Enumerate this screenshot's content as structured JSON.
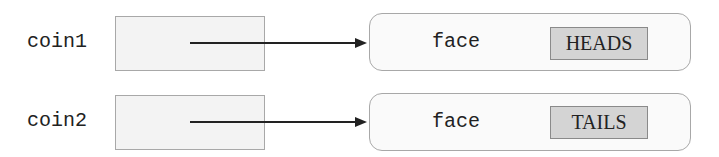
{
  "diagram": {
    "variables": [
      {
        "name": "coin1",
        "object": {
          "field": "face",
          "value": "HEADS"
        }
      },
      {
        "name": "coin2",
        "object": {
          "field": "face",
          "value": "TAILS"
        }
      }
    ],
    "colors": {
      "var_box_fill": "#f3f3f3",
      "value_box_fill": "#d4d4d4",
      "border": "#a8a8a8",
      "arrow": "#222222"
    }
  }
}
